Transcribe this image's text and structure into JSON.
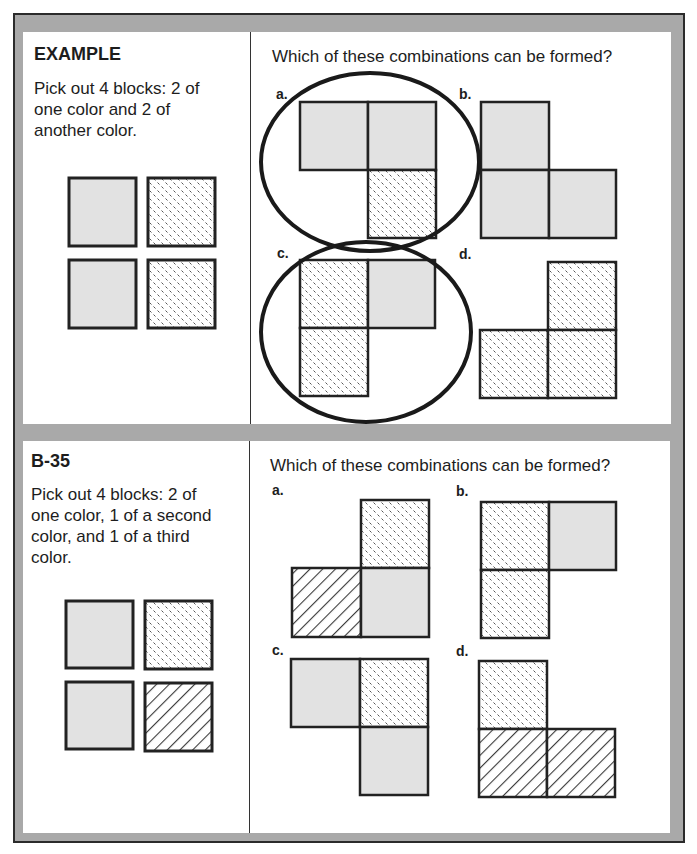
{
  "colors": {
    "frame_gray": "#a9a9a9",
    "frame_border": "#2b2b2b",
    "block_gray": "#e2e2e2",
    "block_outline": "#222222",
    "circle_stroke": "#1a1a1a"
  },
  "legend": {
    "gray": "solid light gray block",
    "dots": "dashed speckle pattern block",
    "stripes": "diagonal stripe pattern block"
  },
  "example": {
    "heading": "EXAMPLE",
    "instruction_lines": [
      "Pick out 4 blocks: 2 of",
      "one color and 2 of",
      "another color."
    ],
    "blocks": [
      "gray",
      "dots",
      "gray",
      "dots"
    ],
    "question": "Which of these combinations can be formed?",
    "options": [
      {
        "label": "a.",
        "blocks": [
          "gray",
          "gray",
          "dots"
        ],
        "circled": true
      },
      {
        "label": "b.",
        "blocks": [
          "gray",
          "gray",
          "gray"
        ],
        "circled": false
      },
      {
        "label": "c.",
        "blocks": [
          "dots",
          "gray",
          "dots"
        ],
        "circled": true
      },
      {
        "label": "d.",
        "blocks": [
          "dots",
          "dots",
          "dots"
        ],
        "circled": false
      }
    ]
  },
  "problem": {
    "heading": "B-35",
    "instruction_lines": [
      "Pick out 4 blocks: 2 of",
      "one color, 1 of a second",
      "color, and 1 of a third",
      "color."
    ],
    "blocks": [
      "gray",
      "dots",
      "gray",
      "stripes"
    ],
    "question": "Which of these combinations can be formed?",
    "options": [
      {
        "label": "a.",
        "blocks": [
          "dots",
          "stripes",
          "gray"
        ]
      },
      {
        "label": "b.",
        "blocks": [
          "dots",
          "gray",
          "dots"
        ]
      },
      {
        "label": "c.",
        "blocks": [
          "gray",
          "dots",
          "gray"
        ]
      },
      {
        "label": "d.",
        "blocks": [
          "dots",
          "stripes",
          "stripes"
        ]
      }
    ]
  }
}
